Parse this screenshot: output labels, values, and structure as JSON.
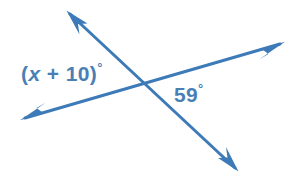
{
  "figure": {
    "background_color": "#ffffff",
    "width": 302,
    "height": 186
  },
  "style": {
    "line_color": "#3d7ab8",
    "line_width": 3,
    "text_color": "#4a7fb5",
    "arrowhead": "barbed"
  },
  "geometry": {
    "intersection": {
      "x": 145,
      "y": 85
    },
    "lines": [
      {
        "id": "line-nw-se",
        "name": "line-upper-left-to-lower-right",
        "from": {
          "x": 68,
          "y": 12
        },
        "to": {
          "x": 237,
          "y": 170
        },
        "arrow_start": true,
        "arrow_end": true
      },
      {
        "id": "line-wsw-ene",
        "name": "line-lower-left-to-upper-right",
        "from": {
          "x": 22,
          "y": 119
        },
        "to": {
          "x": 283,
          "y": 43
        },
        "arrow_start": true,
        "arrow_end": true
      }
    ]
  },
  "labels": {
    "left_angle": {
      "id": "label-x-plus-10",
      "expression_prefix": "(",
      "variable": "x",
      "operator": "+",
      "constant": "10",
      "expression_suffix": ")",
      "degree_symbol": "°",
      "full_text": "(x + 10)°",
      "position": {
        "x": 21,
        "y": 61
      }
    },
    "right_angle": {
      "id": "label-59",
      "value": "59",
      "degree_symbol": "°",
      "full_text": "59°",
      "position": {
        "x": 174,
        "y": 82
      }
    }
  }
}
